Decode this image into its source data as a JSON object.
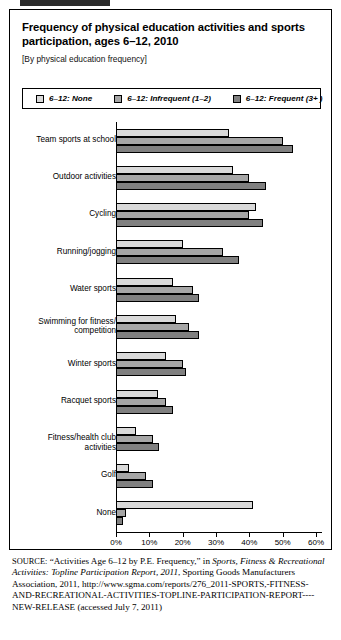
{
  "figure": {
    "title": "Frequency of physical education activities and sports participation, ages 6–12, 2010",
    "subtitle": "[By physical education frequency]"
  },
  "chart_data": {
    "type": "bar",
    "orientation": "horizontal",
    "title": "Frequency of physical education activities and sports participation, ages 6–12, 2010",
    "subtitle": "[By physical education frequency]",
    "xlabel": "",
    "ylabel": "",
    "xlim": [
      0,
      60
    ],
    "xticks": [
      "0%",
      "10%",
      "20%",
      "30%",
      "40%",
      "50%",
      "60%"
    ],
    "xtick_values": [
      0,
      10,
      20,
      30,
      40,
      50,
      60
    ],
    "grid": false,
    "legend_position": "top",
    "categories": [
      "Team sports at school",
      "Outdoor activities",
      "Cycling",
      "Running/jogging",
      "Water sports",
      "Swimming for fitness/ competition",
      "Winter sports",
      "Racquet sports",
      "Fitness/health club activities",
      "Golf",
      "None"
    ],
    "series": [
      {
        "name": "6–12: None",
        "color": "#d9d9d9",
        "values": [
          34,
          35,
          42,
          20,
          17,
          18,
          15,
          12.5,
          6,
          4,
          41
        ]
      },
      {
        "name": "6–12: Infrequent (1–2)",
        "color": "#a6a6a6",
        "values": [
          50,
          40,
          40,
          32,
          23,
          22,
          20,
          15,
          11,
          9,
          3
        ]
      },
      {
        "name": "6–12: Frequent (3+ )",
        "color": "#808080",
        "values": [
          53,
          45,
          44,
          37,
          25,
          25,
          21,
          17,
          13,
          11,
          2
        ]
      }
    ]
  },
  "source": {
    "label": "SOURCE:",
    "part1": "“Activities Age 6–12 by P.E. Frequency,” in ",
    "publication": "Sports, Fitness & Recreational Activities: Topline Participation Report, 2011",
    "part2": ", Sporting Goods Manufacturers Association, 2011, http://www.sgma.com/reports/276_2011-SPORTS,-FITNESS-AND-RECREATIONAL-ACTIVITIES-TOPLINE-PARTICIPATION-REPORT----NEW-RELEASE (accessed July 7, 2011)"
  }
}
